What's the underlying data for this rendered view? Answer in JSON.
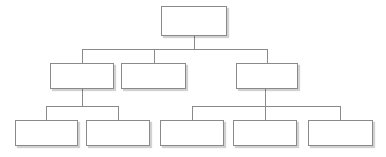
{
  "diagram": {
    "type": "tree",
    "canvas": {
      "width": 386,
      "height": 157,
      "background": "#ffffff"
    },
    "style": {
      "box_fill": "#ffffff",
      "box_border": "#8a8a8a",
      "box_border_width": 1,
      "shadow_color": "rgba(0,0,0,0.18)",
      "connector_color": "#8a8a8a",
      "connector_width": 1
    },
    "levels": 3,
    "nodes": [
      {
        "id": "n1",
        "label": "",
        "level": 1,
        "x": 161,
        "y": 6,
        "w": 66,
        "h": 30,
        "parent": null
      },
      {
        "id": "n2",
        "label": "",
        "level": 2,
        "x": 50,
        "y": 63,
        "w": 64,
        "h": 26,
        "parent": "n1"
      },
      {
        "id": "n3",
        "label": "",
        "level": 2,
        "x": 121,
        "y": 63,
        "w": 65,
        "h": 26,
        "parent": "n1"
      },
      {
        "id": "n4",
        "label": "",
        "level": 2,
        "x": 236,
        "y": 63,
        "w": 62,
        "h": 26,
        "parent": "n1"
      },
      {
        "id": "n5",
        "label": "",
        "level": 3,
        "x": 15,
        "y": 120,
        "w": 63,
        "h": 26,
        "parent": "n2"
      },
      {
        "id": "n6",
        "label": "",
        "level": 3,
        "x": 86,
        "y": 120,
        "w": 64,
        "h": 26,
        "parent": "n2"
      },
      {
        "id": "n7",
        "label": "",
        "level": 3,
        "x": 160,
        "y": 120,
        "w": 64,
        "h": 26,
        "parent": "n4"
      },
      {
        "id": "n8",
        "label": "",
        "level": 3,
        "x": 233,
        "y": 120,
        "w": 64,
        "h": 26,
        "parent": "n4"
      },
      {
        "id": "n9",
        "label": "",
        "level": 3,
        "x": 308,
        "y": 120,
        "w": 65,
        "h": 26,
        "parent": "n4"
      }
    ],
    "connectors": [
      {
        "id": "c-root-stem",
        "from": "n1",
        "points": "194,36 194,49"
      },
      {
        "id": "c-level1-bus",
        "from": "n1",
        "points": "82,49 267,49"
      },
      {
        "id": "c-drop-n2",
        "to": "n2",
        "points": "82,49 82,63"
      },
      {
        "id": "c-drop-n3",
        "to": "n3",
        "points": "154,49 154,63"
      },
      {
        "id": "c-drop-n4",
        "to": "n4",
        "points": "267,49 267,63"
      },
      {
        "id": "c-n2-stem",
        "from": "n2",
        "points": "82,89 82,106"
      },
      {
        "id": "c-n2-bus",
        "from": "n2",
        "points": "46,106 118,106"
      },
      {
        "id": "c-drop-n5",
        "to": "n5",
        "points": "46,106 46,120"
      },
      {
        "id": "c-drop-n6",
        "to": "n6",
        "points": "118,106 118,120"
      },
      {
        "id": "c-n4-stem",
        "from": "n4",
        "points": "265,89 265,106"
      },
      {
        "id": "c-n4-bus",
        "from": "n4",
        "points": "192,106 340,106"
      },
      {
        "id": "c-drop-n7",
        "to": "n7",
        "points": "192,106 192,120"
      },
      {
        "id": "c-drop-n8",
        "to": "n8",
        "points": "265,106 265,120"
      },
      {
        "id": "c-drop-n9",
        "to": "n9",
        "points": "340,106 340,120"
      }
    ]
  }
}
